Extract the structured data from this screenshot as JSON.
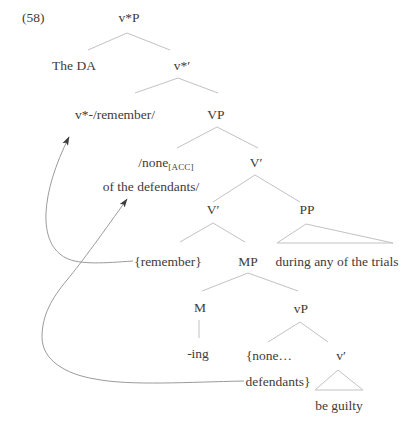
{
  "figure": {
    "number": "(58)",
    "nodes": {
      "vstarP": "v*P",
      "the_da": "The DA",
      "vstar_bar": "v*′",
      "vstar_head": "v*-/remember/",
      "VP": "VP",
      "none_head": "/none",
      "none_sub": "[ACC]",
      "none_line2": "of the defendants/",
      "V_bar_upper": "V′",
      "V_bar_lower": "V′",
      "PP": "PP",
      "remember_trace": "{remember}",
      "MP": "MP",
      "pp_yield": "during any of the trials",
      "M": "M",
      "vP": "vP",
      "ing": "-ing",
      "none_trace_line1": "{none…",
      "v_bar_low": "v′",
      "none_trace_line2": "defendants}",
      "vbar_yield": "be guilty"
    },
    "arrows": [
      {
        "from": "{remember}",
        "to": "v*-/remember/"
      },
      {
        "from": "{none…defendants}",
        "to": "/none[ACC] of the defendants/"
      }
    ],
    "colors": {
      "background": "#ffffff",
      "branch_line": "#c2c2c2",
      "arrow_line": "#9b9b9b",
      "arrowhead": "#3c3c3c",
      "text": "#3f3b38"
    }
  }
}
